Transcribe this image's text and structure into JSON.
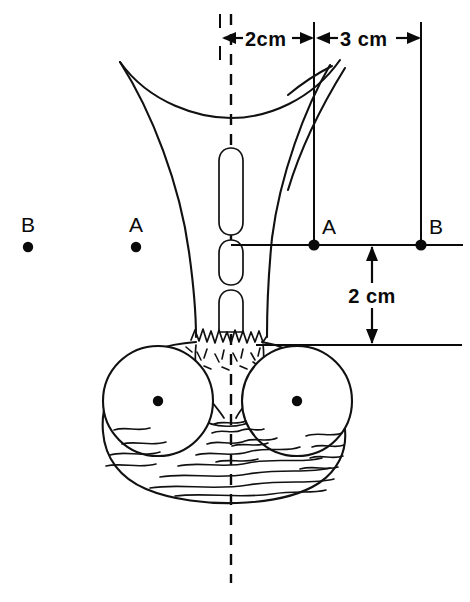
{
  "figure": {
    "background_color": "#ffffff",
    "line_color": "#111111",
    "width": 470,
    "height": 602
  },
  "dimensions": {
    "top_left": {
      "label": "2cm",
      "value": 2,
      "unit": "cm",
      "orientation": "horizontal",
      "arrow_style": "double-headed"
    },
    "top_right": {
      "label": "3 cm",
      "value": 3,
      "unit": "cm",
      "orientation": "horizontal",
      "arrow_style": "double-headed"
    },
    "vertical": {
      "label": "2 cm",
      "value": 2,
      "unit": "cm",
      "orientation": "vertical",
      "arrow_style": "double-headed"
    }
  },
  "points": {
    "left_group": [
      {
        "label": "B",
        "x": 28,
        "y": 243
      },
      {
        "label": "A",
        "x": 136,
        "y": 243
      }
    ],
    "right_group": [
      {
        "label": "A",
        "x": 314,
        "y": 245
      },
      {
        "label": "B",
        "x": 421,
        "y": 245
      }
    ]
  },
  "annotations": {
    "centerline_style": "dashed",
    "reference_line_label": "horizontal reference line",
    "datum_line_label": "lower datum line"
  }
}
